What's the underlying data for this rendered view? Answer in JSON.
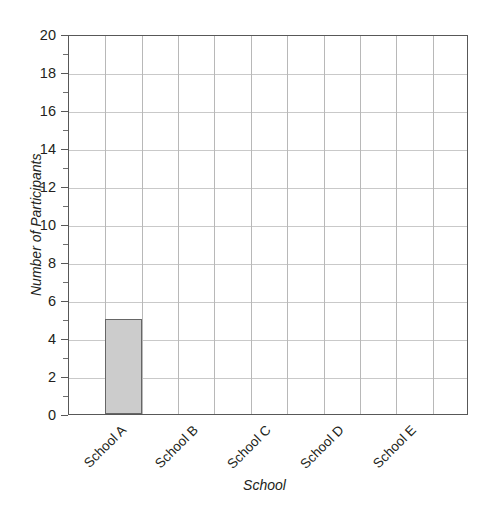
{
  "chart_data": {
    "type": "bar",
    "title": "",
    "subtitle": "",
    "xlabel": "School",
    "ylabel": "Number of Participants",
    "categories": [
      "School A",
      "School B",
      "School C",
      "School D",
      "School E"
    ],
    "values": [
      5,
      0,
      0,
      0,
      0
    ],
    "series": [
      {
        "name": "Number of Participants",
        "values": [
          5,
          0,
          0,
          0,
          0
        ]
      }
    ],
    "ylim": [
      0,
      20
    ],
    "ytick_labels": [
      "0",
      "2",
      "4",
      "6",
      "8",
      "10",
      "12",
      "14",
      "16",
      "18",
      "20"
    ],
    "ytick_values": [
      0,
      2,
      4,
      6,
      8,
      10,
      12,
      14,
      16,
      18,
      20
    ],
    "yminor_values": [
      1,
      3,
      5,
      7,
      9,
      11,
      13,
      15,
      17,
      19
    ],
    "grid": true,
    "grid_axis": "both",
    "vertical_grid_columns": 11,
    "legend": false,
    "legend_position": "none",
    "annotations": [],
    "colors": {
      "bar_fill": "#cccccc",
      "bar_border": "#666666",
      "grid_horizontal": "#c9c9c9",
      "grid_vertical": "#b8b8b8",
      "axis": "#585858",
      "text": "#231f20",
      "background": "#ffffff"
    },
    "xtick_rotation": -45
  }
}
